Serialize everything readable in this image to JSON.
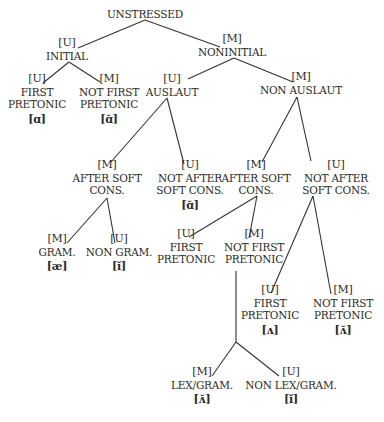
{
  "diagram": {
    "type": "feature-tree",
    "root": {
      "label": "UNSTRESSED"
    },
    "nodes": {
      "initial": {
        "feature": "[U]",
        "label": "INITIAL"
      },
      "noninitial": {
        "feature": "[M]",
        "label": "NONINITIAL"
      },
      "initial_first_pretonic": {
        "feature": "[U]",
        "label_line1": "FIRST",
        "label_line2": "PRETONIC",
        "phone": "[ɑ]"
      },
      "initial_not_first_pretonic": {
        "feature": "[M]",
        "label_line1": "NOT FIRST",
        "label_line2": "PRETONIC",
        "phone": "[ɑ̆]"
      },
      "auslaut": {
        "feature": "[U]",
        "label": "AUSLAUT"
      },
      "non_auslaut": {
        "feature": "[M]",
        "label": "NON AUSLAUT"
      },
      "auslaut_after_soft": {
        "feature": "[M]",
        "label_line1": "AFTER SOFT",
        "label_line2": "CONS."
      },
      "auslaut_not_after_soft": {
        "feature": "[U]",
        "label_line1": "NOT AFTER",
        "label_line2": "SOFT CONS.",
        "phone": "[ɑ̆]"
      },
      "gram": {
        "feature": "[M]",
        "label": "GRAM.",
        "phone": "[æ]"
      },
      "non_gram": {
        "feature": "[U]",
        "label": "NON GRAM.",
        "phone": "[ĭ]"
      },
      "nonauslaut_after_soft": {
        "feature": "[M]",
        "label_line1": "AFTER SOFT",
        "label_line2": "CONS."
      },
      "nonauslaut_not_after_soft": {
        "feature": "[U]",
        "label_line1": "NOT AFTER",
        "label_line2": "SOFT CONS."
      },
      "soft_first_pretonic": {
        "feature": "[U]",
        "label_line1": "FIRST",
        "label_line2": "PRETONIC"
      },
      "soft_not_first_pretonic": {
        "feature": "[M]",
        "label_line1": "NOT FIRST",
        "label_line2": "PRETONIC"
      },
      "hard_first_pretonic": {
        "feature": "[U]",
        "label_line1": "FIRST",
        "label_line2": "PRETONIC",
        "phone": "[ʌ]"
      },
      "hard_not_first_pretonic": {
        "feature": "[M]",
        "label_line1": "NOT FIRST",
        "label_line2": "PRETONIC",
        "phone": "[ʌ̆]"
      },
      "lex_gram": {
        "feature": "[M]",
        "label": "LEX/GRAM.",
        "phone": "[ʌ̆]"
      },
      "non_lex_gram": {
        "feature": "[U]",
        "label": "NON LEX/GRAM.",
        "phone": "[ĭ]"
      }
    },
    "edges": [
      [
        "UNSTRESSED",
        "INITIAL"
      ],
      [
        "UNSTRESSED",
        "NONINITIAL"
      ],
      [
        "INITIAL",
        "FIRST PRETONIC"
      ],
      [
        "INITIAL",
        "NOT FIRST PRETONIC"
      ],
      [
        "NONINITIAL",
        "AUSLAUT"
      ],
      [
        "NONINITIAL",
        "NON AUSLAUT"
      ],
      [
        "AUSLAUT",
        "AFTER SOFT CONS."
      ],
      [
        "AUSLAUT",
        "NOT AFTER SOFT CONS."
      ],
      [
        "AFTER SOFT CONS. (auslaut)",
        "GRAM."
      ],
      [
        "AFTER SOFT CONS. (auslaut)",
        "NON GRAM."
      ],
      [
        "NON AUSLAUT",
        "AFTER SOFT CONS."
      ],
      [
        "NON AUSLAUT",
        "NOT AFTER SOFT CONS."
      ],
      [
        "AFTER SOFT CONS. (non auslaut)",
        "FIRST PRETONIC"
      ],
      [
        "AFTER SOFT CONS. (non auslaut)",
        "NOT FIRST PRETONIC"
      ],
      [
        "NOT FIRST PRETONIC (soft)",
        "LEX/GRAM."
      ],
      [
        "NOT FIRST PRETONIC (soft)",
        "NON LEX/GRAM."
      ],
      [
        "NOT AFTER SOFT CONS. (non auslaut)",
        "FIRST PRETONIC"
      ],
      [
        "NOT AFTER SOFT CONS. (non auslaut)",
        "NOT FIRST PRETONIC"
      ]
    ]
  }
}
